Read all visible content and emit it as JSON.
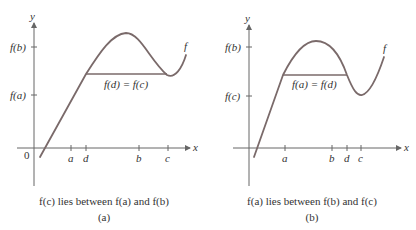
{
  "panels": [
    {
      "id": "a",
      "axis_labels": {
        "y": "y",
        "x": "x",
        "origin": "0"
      },
      "y_ticks": [
        "f(b)",
        "f(a)"
      ],
      "x_ticks": [
        "a",
        "d",
        "b",
        "c"
      ],
      "curve_label": "f",
      "segment_label": "f(d) = f(c)",
      "caption": "f(c) lies between f(a) and f(b)",
      "sublabel": "(a)"
    },
    {
      "id": "b",
      "axis_labels": {
        "y": "y",
        "x": "x"
      },
      "y_ticks": [
        "f(b)",
        "f(c)"
      ],
      "x_ticks": [
        "a",
        "b",
        "d",
        "c"
      ],
      "curve_label": "f",
      "segment_label": "f(a) = f(d)",
      "caption": "f(a) lies between f(b) and f(c)",
      "sublabel": "(b)"
    }
  ],
  "colors": {
    "curve": "#7a6a6a",
    "axis": "#666666",
    "text": "#333333"
  }
}
